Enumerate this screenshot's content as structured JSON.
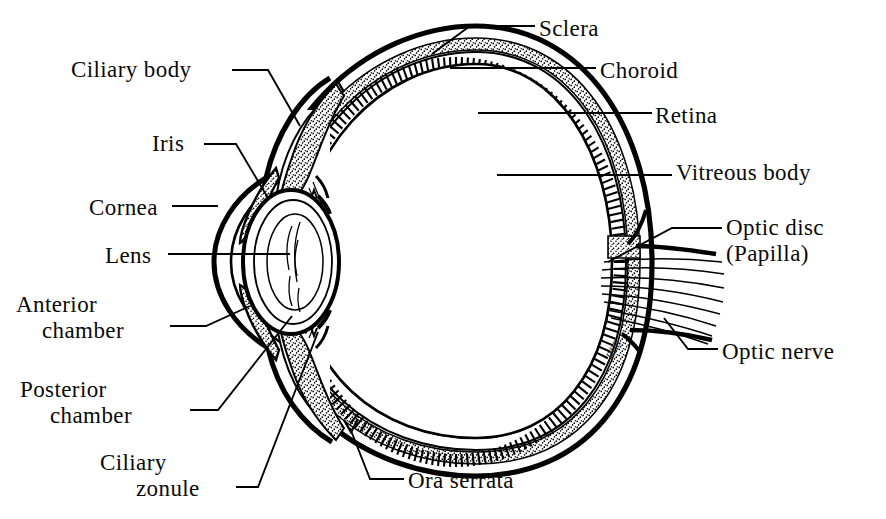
{
  "figure": {
    "style": "black-and-white line drawing",
    "background_color": "#ffffff",
    "ink_color": "#000000",
    "signature": "RBE"
  },
  "labels": [
    {
      "id": "sclera",
      "text": "Sclera",
      "line2": "",
      "side": "right",
      "x": 539,
      "y": 16
    },
    {
      "id": "choroid",
      "text": "Choroid",
      "line2": "",
      "side": "right",
      "x": 600,
      "y": 58
    },
    {
      "id": "retina",
      "text": "Retina",
      "line2": "",
      "side": "right",
      "x": 655,
      "y": 103
    },
    {
      "id": "vitreous-body",
      "text": "Vitreous body",
      "line2": "",
      "side": "right",
      "x": 676,
      "y": 160
    },
    {
      "id": "optic-disc",
      "text": "Optic disc",
      "line2": "(Papilla)",
      "side": "right",
      "x": 726,
      "y": 215
    },
    {
      "id": "optic-nerve",
      "text": "Optic nerve",
      "line2": "",
      "side": "right",
      "x": 722,
      "y": 339
    },
    {
      "id": "ciliary-body",
      "text": "Ciliary body",
      "line2": "",
      "side": "left",
      "x": 71,
      "y": 57
    },
    {
      "id": "iris",
      "text": "Iris",
      "line2": "",
      "side": "left",
      "x": 152,
      "y": 131
    },
    {
      "id": "cornea",
      "text": "Cornea",
      "line2": "",
      "side": "left",
      "x": 89,
      "y": 195
    },
    {
      "id": "lens",
      "text": "Lens",
      "line2": "",
      "side": "left",
      "x": 105,
      "y": 243
    },
    {
      "id": "anterior-chamber",
      "text": "Anterior",
      "line2": "chamber",
      "side": "left",
      "x": 16,
      "y": 292
    },
    {
      "id": "posterior-chamber",
      "text": "Posterior",
      "line2": "chamber",
      "side": "left",
      "x": 20,
      "y": 377
    },
    {
      "id": "ciliary-zonule",
      "text": "Ciliary",
      "line2": "zonule",
      "side": "left",
      "x": 100,
      "y": 450
    },
    {
      "id": "ora-serrata",
      "text": "Ora serrata",
      "line2": "",
      "side": "bottom",
      "x": 408,
      "y": 468
    }
  ],
  "structures": [
    {
      "id": "sclera",
      "name": "Sclera",
      "render": "thick outer shell outline"
    },
    {
      "id": "choroid",
      "name": "Choroid",
      "render": "stippled middle layer"
    },
    {
      "id": "retina",
      "name": "Retina",
      "render": "ladder-hatched inner layer"
    },
    {
      "id": "vitreous-body",
      "name": "Vitreous body",
      "render": "large empty interior chamber"
    },
    {
      "id": "cornea",
      "name": "Cornea",
      "render": "anterior transparent dome"
    },
    {
      "id": "lens",
      "name": "Lens",
      "render": "biconvex concentric oval"
    },
    {
      "id": "iris",
      "name": "Iris",
      "render": "stippled flap anterior to lens"
    },
    {
      "id": "ciliary-body",
      "name": "Ciliary body",
      "render": "stippled wedge at lens equator"
    },
    {
      "id": "ciliary-zonule",
      "name": "Ciliary zonule",
      "render": "fine suspensory fibers"
    },
    {
      "id": "anterior-chamber",
      "name": "Anterior chamber",
      "render": "space between cornea and iris"
    },
    {
      "id": "posterior-chamber",
      "name": "Posterior chamber",
      "render": "space between iris and lens"
    },
    {
      "id": "ora-serrata",
      "name": "Ora serrata",
      "render": "serrated retinal termination"
    },
    {
      "id": "optic-disc",
      "name": "Optic disc (Papilla)",
      "render": "posterior pole break in retina"
    },
    {
      "id": "optic-nerve",
      "name": "Optic nerve",
      "render": "fiber bundle leaving posterior pole"
    }
  ]
}
